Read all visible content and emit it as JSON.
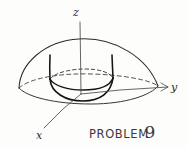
{
  "figure": {
    "background_color": "#fdfdfc",
    "ink_color": "#2b2b2b",
    "style": "hand-drawn pencil sketch"
  },
  "axes": {
    "z_label": "z",
    "y_label": "y",
    "x_label": "x"
  },
  "caption": {
    "word": "PROBLEM",
    "number": "9"
  },
  "shapes": {
    "dome_name": "hemisphere-dome",
    "cylinder_name": "inscribed-cylinder",
    "base_ellipse_name": "dome-base-ellipse",
    "cylinder_top_ellipse_name": "cylinder-top-ellipse",
    "cylinder_bottom_name": "cylinder-bottom-arc"
  }
}
